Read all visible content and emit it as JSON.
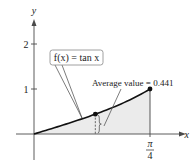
{
  "chart_data": {
    "type": "area",
    "title": "",
    "function_label": "f(x) = tan x",
    "annotation": "Average value = 0.441",
    "average_value": 0.441,
    "xlabel": "x",
    "ylabel": "y",
    "x_domain": [
      0,
      0.7854
    ],
    "xlim": [
      0,
      0.99
    ],
    "ylim": [
      0,
      2.5
    ],
    "y_ticks": [
      {
        "value": 1,
        "label": "1"
      },
      {
        "value": 2,
        "label": "2"
      }
    ],
    "x_ticks": [
      {
        "value": 0.7854,
        "label_num": "π",
        "label_den": "4"
      }
    ],
    "endpoint": {
      "x": 0.7854,
      "y": 1
    },
    "average_point": {
      "x": 0.4152,
      "y": 0.441
    },
    "shaded_region": "under f(x) from 0 to π/4",
    "grid": false,
    "colors": {
      "fill": "#ebebeb",
      "curve": "#111111"
    }
  }
}
